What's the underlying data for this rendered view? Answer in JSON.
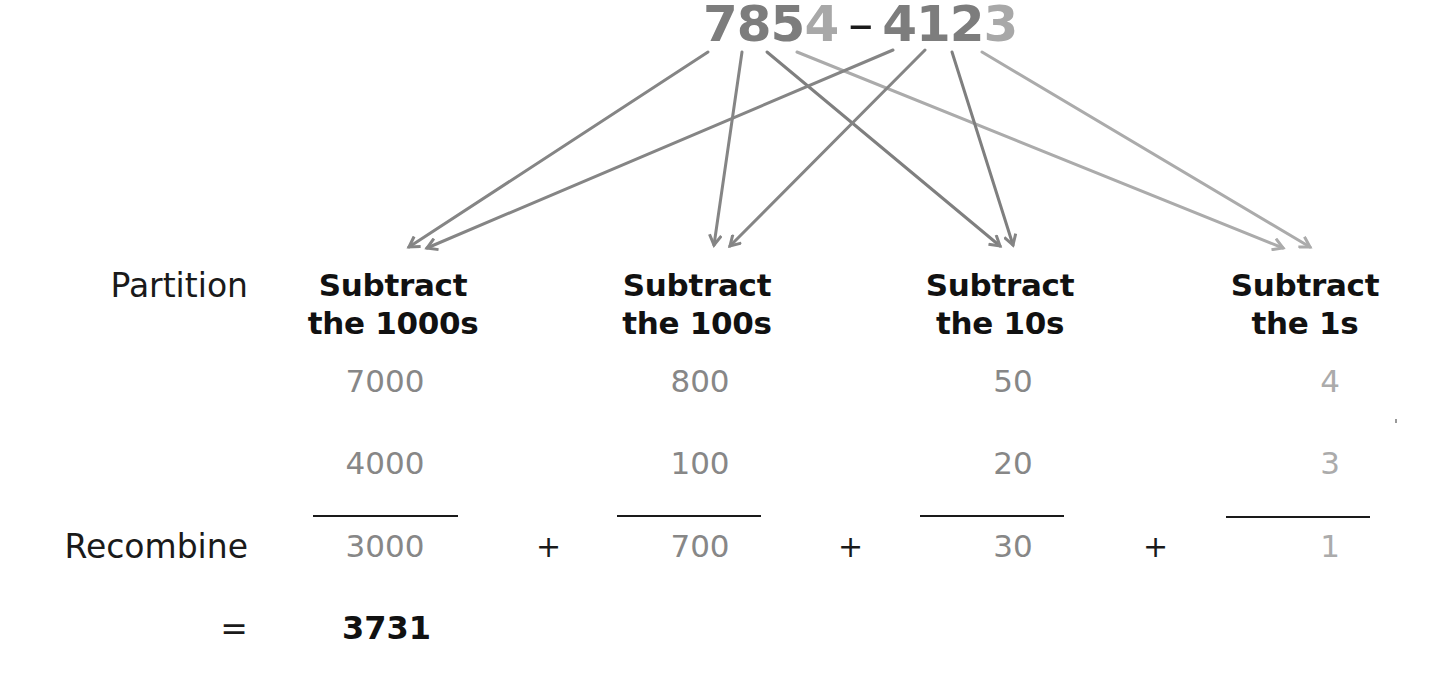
{
  "problem": {
    "minuend": [
      "7",
      "8",
      "5",
      "4"
    ],
    "operator": "–",
    "subtrahend": [
      "4",
      "1",
      "2",
      "3"
    ]
  },
  "rows": {
    "partition_label": "Partition",
    "recombine_label": "Recombine",
    "equals_label": "="
  },
  "columns": [
    {
      "heading_line1": "Subtract",
      "heading_line2": "the 1000s",
      "top": "7000",
      "bottom": "4000",
      "result": "3000"
    },
    {
      "heading_line1": "Subtract",
      "heading_line2": "the 100s",
      "top": "800",
      "bottom": "100",
      "result": "700"
    },
    {
      "heading_line1": "Subtract",
      "heading_line2": "the 10s",
      "top": "50",
      "bottom": "20",
      "result": "30"
    },
    {
      "heading_line1": "Subtract",
      "heading_line2": "the 1s",
      "top": "4",
      "bottom": "3",
      "result": "1"
    }
  ],
  "plus_signs": [
    "+",
    "+",
    "+"
  ],
  "answer": "3731",
  "colors": {
    "digit_dark": "#7d7d7d",
    "digit_light": "#a8a8a8",
    "arrow_dark": "#858585",
    "arrow_light": "#ababab",
    "text": "#111111"
  },
  "arrows": [
    {
      "from_digit": "7",
      "to": "Subtract the 1000s"
    },
    {
      "from_digit": "8",
      "to": "Subtract the 100s"
    },
    {
      "from_digit": "5",
      "to": "Subtract the 10s"
    },
    {
      "from_digit": "4",
      "to": "Subtract the 1s"
    },
    {
      "from_digit": "4",
      "to": "Subtract the 1000s"
    },
    {
      "from_digit": "1",
      "to": "Subtract the 100s"
    },
    {
      "from_digit": "2",
      "to": "Subtract the 10s"
    },
    {
      "from_digit": "3",
      "to": "Subtract the 1s"
    }
  ]
}
